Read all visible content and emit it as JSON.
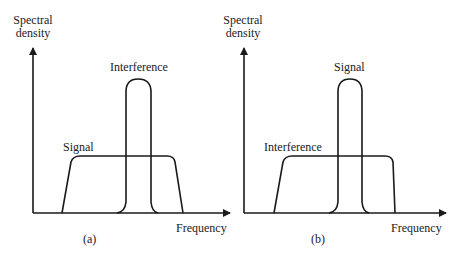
{
  "panels": [
    {
      "id": "a",
      "caption": "(a)",
      "y_label_line1": "Spectral",
      "y_label_line2": "density",
      "x_label": "Frequency",
      "wide_label": "Signal",
      "narrow_label": "Interference"
    },
    {
      "id": "b",
      "caption": "(b)",
      "y_label_line1": "Spectral",
      "y_label_line2": "density",
      "x_label": "Frequency",
      "wide_label": "Interference",
      "narrow_label": "Signal"
    }
  ],
  "colors": {
    "line": "#1a1a1a",
    "text": "#222222"
  }
}
